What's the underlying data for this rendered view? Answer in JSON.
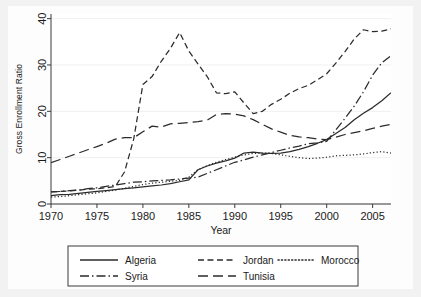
{
  "chart_data": {
    "type": "line",
    "title": "",
    "xlabel": "Year",
    "ylabel": "Gross Enrollment Ratio",
    "xlim": [
      1970,
      2007
    ],
    "ylim": [
      0,
      41
    ],
    "xticks": [
      "1970",
      "1975",
      "1980",
      "1985",
      "1990",
      "1995",
      "2000",
      "2005"
    ],
    "xtick_values": [
      1970,
      1975,
      1980,
      1985,
      1990,
      1995,
      2000,
      2005
    ],
    "yticks": [
      "0",
      "10",
      "20",
      "30",
      "40"
    ],
    "ytick_values": [
      0,
      10,
      20,
      30,
      40
    ],
    "grid": false,
    "legend_position": "below",
    "x": [
      1970,
      1971,
      1972,
      1973,
      1974,
      1975,
      1976,
      1977,
      1978,
      1979,
      1980,
      1981,
      1982,
      1983,
      1984,
      1985,
      1986,
      1987,
      1988,
      1989,
      1990,
      1991,
      1992,
      1993,
      1994,
      1995,
      1996,
      1997,
      1998,
      1999,
      2000,
      2001,
      2002,
      2003,
      2004,
      2005,
      2006,
      2007
    ],
    "series": [
      {
        "name": "Algeria",
        "style": "solid",
        "values": [
          1.8,
          2.0,
          2.1,
          2.3,
          2.5,
          2.7,
          2.9,
          3.1,
          3.3,
          3.5,
          3.7,
          3.9,
          4.1,
          4.4,
          4.8,
          5.2,
          7.4,
          8.2,
          8.8,
          9.3,
          9.9,
          11.0,
          11.2,
          11.0,
          10.9,
          11.0,
          11.3,
          11.8,
          12.4,
          13.1,
          13.9,
          15.2,
          16.5,
          18.2,
          19.6,
          20.8,
          22.3,
          24.0
        ]
      },
      {
        "name": "Jordan",
        "style": "dashed",
        "values": [
          2.6,
          2.7,
          2.8,
          3.0,
          3.2,
          3.3,
          3.5,
          3.8,
          6.9,
          14.0,
          25.8,
          27.5,
          30.8,
          33.6,
          37.0,
          33.0,
          30.2,
          27.5,
          24.0,
          23.8,
          24.2,
          21.8,
          19.5,
          20.0,
          21.5,
          22.6,
          23.9,
          24.9,
          25.6,
          26.8,
          28.1,
          30.4,
          32.9,
          35.6,
          37.6,
          37.2,
          37.3,
          37.8
        ]
      },
      {
        "name": "Morocco",
        "style": "dotted",
        "values": [
          1.5,
          1.6,
          1.8,
          2.0,
          2.2,
          2.4,
          2.7,
          3.0,
          3.4,
          3.8,
          4.2,
          4.5,
          4.7,
          4.9,
          5.1,
          5.8,
          7.4,
          8.3,
          9.0,
          9.6,
          10.1,
          10.6,
          10.9,
          11.0,
          10.9,
          10.6,
          10.3,
          10.0,
          9.8,
          9.9,
          10.1,
          10.4,
          10.5,
          10.6,
          10.8,
          11.1,
          11.3,
          11.0
        ]
      },
      {
        "name": "Syria",
        "style": "dashdot",
        "values": [
          2.6,
          2.7,
          2.9,
          3.0,
          3.3,
          3.5,
          3.8,
          4.1,
          4.4,
          4.7,
          4.8,
          5.0,
          5.1,
          5.2,
          5.4,
          5.6,
          5.8,
          6.6,
          7.4,
          8.2,
          9.0,
          9.5,
          10.1,
          10.6,
          11.1,
          11.6,
          12.1,
          12.5,
          13.0,
          13.2,
          13.5,
          16.0,
          18.5,
          21.1,
          24.2,
          27.8,
          30.5,
          32.0
        ]
      },
      {
        "name": "Tunisia",
        "style": "longdash",
        "values": [
          8.9,
          9.6,
          10.3,
          11.0,
          11.7,
          12.4,
          13.1,
          14.0,
          14.3,
          14.3,
          15.6,
          16.8,
          16.6,
          17.3,
          17.4,
          17.6,
          17.8,
          18.1,
          19.3,
          19.5,
          19.4,
          19.0,
          18.2,
          17.2,
          16.2,
          15.5,
          14.8,
          14.5,
          14.3,
          14.0,
          13.9,
          14.4,
          15.0,
          15.4,
          15.8,
          16.3,
          16.8,
          17.2
        ]
      }
    ]
  },
  "legend": {
    "entries": [
      {
        "label": "Algeria",
        "style": "solid"
      },
      {
        "label": "Jordan",
        "style": "dashed"
      },
      {
        "label": "Morocco",
        "style": "dotted"
      },
      {
        "label": "Syria",
        "style": "dashdot"
      },
      {
        "label": "Tunisia",
        "style": "longdash"
      }
    ]
  },
  "colors": {
    "line": "#2b2b2b",
    "axis": "#3a3a3a",
    "plot_background": "#ffffff",
    "figure_background": "#f2f2f2"
  }
}
